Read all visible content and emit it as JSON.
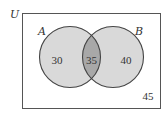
{
  "diagram": {
    "type": "venn",
    "universe_label": "U",
    "sets": [
      {
        "label": "A",
        "only_value": "30"
      },
      {
        "label": "B",
        "only_value": "40"
      }
    ],
    "intersection_value": "35",
    "outside_value": "45",
    "colors": {
      "set_fill": "#d9d9d9",
      "intersection_fill": "#a8a8a8",
      "stroke": "#444444",
      "background": "#ffffff"
    }
  }
}
